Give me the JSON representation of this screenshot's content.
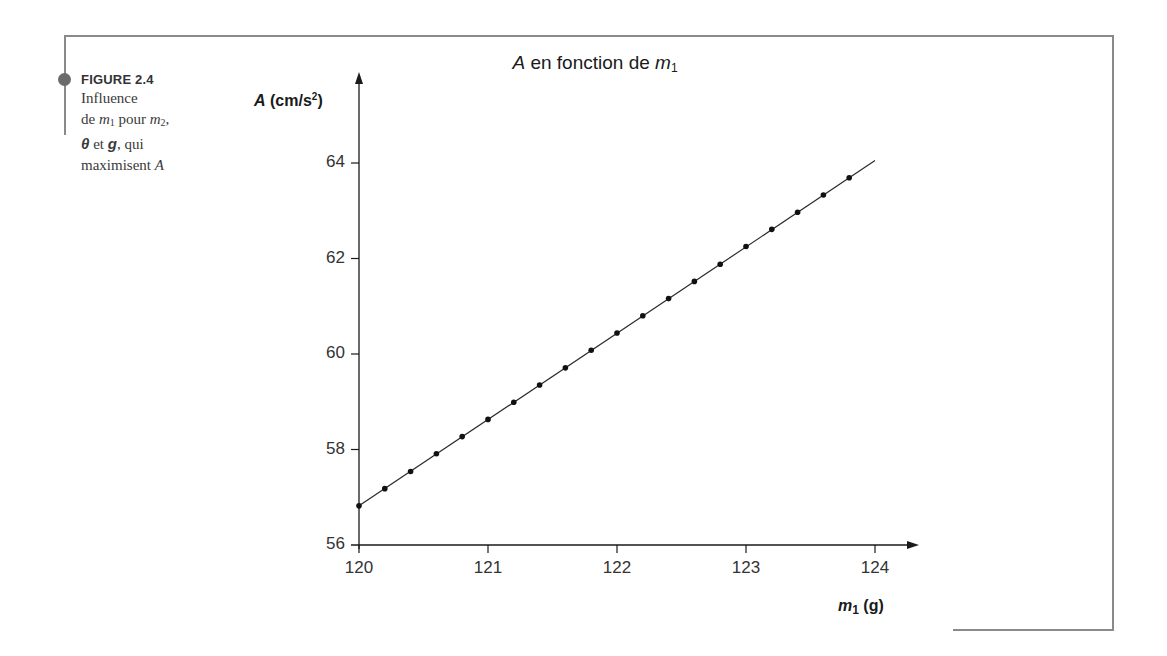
{
  "figure": {
    "label": "FIGURE 2.4",
    "caption_lines": [
      "Influence",
      "de m1 pour m2,",
      "θ et g, qui",
      "maximisent A"
    ],
    "caption_parts": {
      "line1": "Influence",
      "de": "de ",
      "m": "m",
      "sub1": "1",
      "pour": " pour ",
      "sub2": "2",
      "comma": ",",
      "theta": "θ",
      "et": " et ",
      "g": "g",
      "qui": ", qui",
      "maximisent": "maximisent ",
      "A": "A"
    }
  },
  "chart_data": {
    "type": "line",
    "title": "A en fonction de m1",
    "title_parts": {
      "A": "A",
      "mid": " en fonction de ",
      "m": "m",
      "sub": "1"
    },
    "xlabel": "m1 (g)",
    "xlabel_parts": {
      "m": "m",
      "sub": "1",
      "unit": " (g)"
    },
    "ylabel": "A (cm/s²)",
    "ylabel_parts": {
      "A": "A",
      "unit_open": " (cm/s",
      "sup": "2",
      "unit_close": ")"
    },
    "xlim": [
      120,
      124.3
    ],
    "ylim": [
      56,
      64.8
    ],
    "xticks": [
      120,
      121,
      122,
      123,
      124
    ],
    "yticks": [
      56,
      58,
      60,
      62,
      64
    ],
    "grid": false,
    "legend": null,
    "markers": true,
    "x": [
      120.0,
      120.2,
      120.4,
      120.6,
      120.8,
      121.0,
      121.2,
      121.4,
      121.6,
      121.8,
      122.0,
      122.2,
      122.4,
      122.6,
      122.8,
      123.0,
      123.2,
      123.4,
      123.6,
      123.8
    ],
    "values": [
      56.82,
      57.18,
      57.54,
      57.91,
      58.27,
      58.63,
      58.99,
      59.35,
      59.71,
      60.08,
      60.44,
      60.8,
      61.16,
      61.52,
      61.88,
      62.25,
      62.61,
      62.97,
      63.33,
      63.69
    ],
    "fit_line": {
      "x_start": 120.0,
      "y_start": 56.82,
      "x_end": 124.0,
      "y_end": 64.05
    }
  }
}
